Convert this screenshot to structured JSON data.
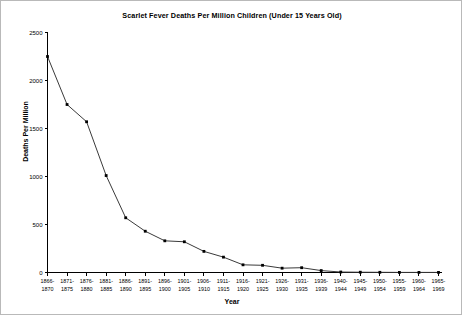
{
  "chart_data": {
    "type": "line",
    "title": "Scarlet Fever Deaths Per Million Children (Under 15 Years Old)",
    "xlabel": "Year",
    "ylabel": "Deaths Per Million",
    "ylim": [
      0,
      2500
    ],
    "ytick_values": [
      0,
      500,
      1000,
      1500,
      2000,
      2500
    ],
    "ytick_labels": [
      "0",
      "500",
      "1000",
      "1500",
      "2000",
      "2500"
    ],
    "grid": false,
    "legend": false,
    "marker": "filled-square",
    "line_color": "#3a3a3a",
    "marker_color": "#000000",
    "categories": [
      "1866-1870",
      "1871-1875",
      "1876-1880",
      "1881-1885",
      "1886-1890",
      "1891-1895",
      "1896-1900",
      "1901-1905",
      "1906-1910",
      "1911-1915",
      "1916-1920",
      "1921-1925",
      "1926-1930",
      "1931-1935",
      "1936-1939",
      "1940-1944",
      "1945-1949",
      "1950-1954",
      "1955-1959",
      "1960-1964",
      "1965-1969"
    ],
    "xtick_labels_line1": [
      "1866-",
      "1871-",
      "1876-",
      "1881-",
      "1886-",
      "1891-",
      "1896-",
      "1901-",
      "1906-",
      "1911-",
      "1916-",
      "1921-",
      "1926-",
      "1931-",
      "1936-",
      "1940-",
      "1945-",
      "1950-",
      "1955-",
      "1960-",
      "1965-"
    ],
    "xtick_labels_line2": [
      "1870",
      "1875",
      "1880",
      "1885",
      "1890",
      "1895",
      "1900",
      "1905",
      "1910",
      "1915",
      "1920",
      "1925",
      "1930",
      "1935",
      "1939",
      "1944",
      "1949",
      "1954",
      "1959",
      "1964",
      "1969"
    ],
    "values": [
      2250,
      1750,
      1570,
      1010,
      570,
      430,
      330,
      320,
      220,
      160,
      80,
      75,
      45,
      50,
      20,
      5,
      3,
      2,
      1,
      1,
      1
    ]
  }
}
